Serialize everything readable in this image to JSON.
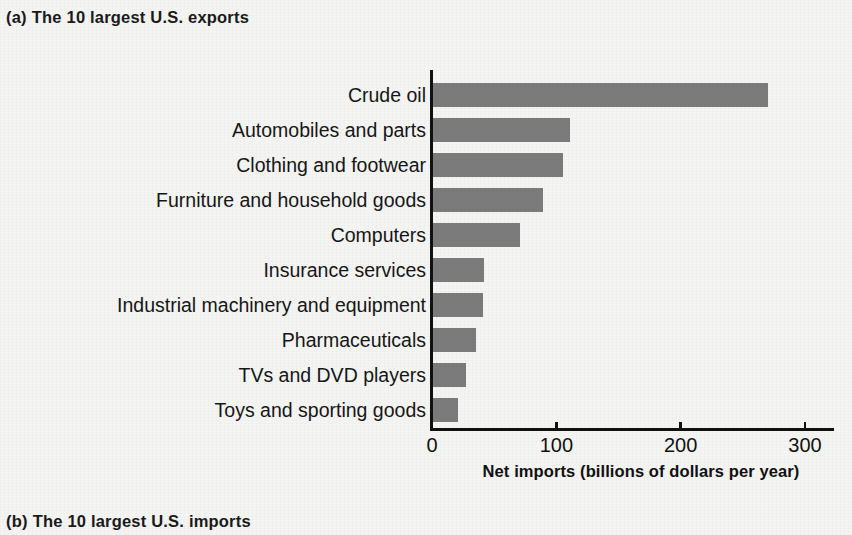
{
  "panels": {
    "a": {
      "tag": "(a)",
      "text": "The 10 largest U.S. exports"
    },
    "b": {
      "tag": "(b)",
      "text": "The 10 largest U.S. imports"
    }
  },
  "axis": {
    "title": "Net imports (billions of dollars per year)",
    "ticks": [
      "0",
      "100",
      "200",
      "300"
    ]
  },
  "colors": {
    "bar": "#7b7b7b",
    "axis": "#111111",
    "background": "#f4f4f2"
  },
  "chart_data": {
    "type": "bar",
    "orientation": "horizontal",
    "xlabel": "Net imports (billions of dollars per year)",
    "ylabel": "",
    "xlim": [
      0,
      320
    ],
    "xticks": [
      0,
      100,
      200,
      300
    ],
    "grid": false,
    "legend": "none",
    "categories": [
      "Crude oil",
      "Automobiles and parts",
      "Clothing and footwear",
      "Furniture and household goods",
      "Computers",
      "Insurance services",
      "Industrial machinery and equipment",
      "Pharmaceuticals",
      "TVs and DVD players",
      "Toys and sporting goods"
    ],
    "values": [
      270,
      111,
      105,
      89,
      71,
      42,
      41,
      35,
      27,
      21
    ],
    "series": [
      {
        "name": "Net imports",
        "values": [
          270,
          111,
          105,
          89,
          71,
          42,
          41,
          35,
          27,
          21
        ]
      }
    ]
  }
}
